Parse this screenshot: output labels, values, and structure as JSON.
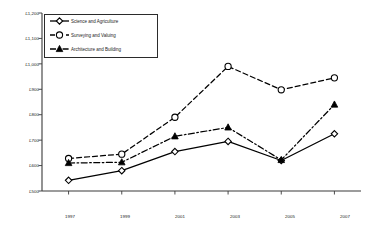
{
  "chart_data": {
    "type": "line",
    "title": "",
    "xlabel": "",
    "ylabel": "",
    "categories": [
      "1997",
      "1999",
      "2001",
      "2003",
      "2005",
      "2007"
    ],
    "x": [
      1997,
      1999,
      2001,
      2003,
      2005,
      2007
    ],
    "ylim": [
      500,
      1200
    ],
    "ytick_values": [
      1200,
      1100,
      1000,
      900,
      800,
      700,
      600,
      500
    ],
    "ytick_labels": [
      "£1,200",
      "£1,100",
      "£1,000",
      "£900",
      "£800",
      "£700",
      "£600",
      "£500"
    ],
    "grid": false,
    "legend_position": "top-left",
    "currency": "£",
    "series": [
      {
        "name": "Science and Agriculture",
        "line_style": "solid",
        "marker": "open-diamond",
        "color": "#000000",
        "values": [
          542,
          580,
          655,
          695,
          620,
          725
        ]
      },
      {
        "name": "Surveying and Valuing",
        "line_style": "dashed",
        "marker": "open-circle",
        "color": "#000000",
        "values": [
          628,
          645,
          790,
          990,
          898,
          945
        ]
      },
      {
        "name": "Architecture and Building",
        "line_style": "dash-dot",
        "marker": "filled-triangle",
        "color": "#000000",
        "values": [
          610,
          613,
          715,
          750,
          622,
          840
        ]
      }
    ]
  },
  "legend": {
    "items": [
      {
        "label": "Science and Agriculture"
      },
      {
        "label": "Surveying and Valuing"
      },
      {
        "label": "Architecture and Building"
      }
    ]
  },
  "axes": {
    "y_labels": [
      "£1,200",
      "£1,100",
      "£1,000",
      "£900",
      "£800",
      "£700",
      "£600",
      "£500"
    ],
    "x_labels": [
      "1997",
      "1999",
      "2001",
      "2003",
      "2005",
      "2007"
    ]
  },
  "style": {
    "axis_color": "#3a3a3a",
    "ink_color": "#000000",
    "background": "#ffffff"
  }
}
